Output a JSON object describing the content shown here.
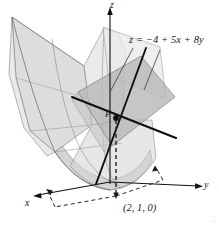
{
  "figure": {
    "caption_absent": true,
    "labels": {
      "plane_equation": "z = −4 + 5x + 8y",
      "point_coords": "(2, 1, 0)",
      "point_name": "P",
      "axis_z": "z",
      "axis_y": "y",
      "axis_x": "x",
      "page_artifact": "2"
    },
    "colors": {
      "background": "#ffffff",
      "surface_fill": "#d6d6d6",
      "surface_fill_light": "#e4e4e4",
      "surface_fill_pale": "#ececeb",
      "plane_fill": "#b9b9b9",
      "plane_fill_light": "#cfcfcf",
      "outline": "#6f6f6f",
      "axis": "#111111",
      "tangent_line": "#111111",
      "dashed": "#2b2b2b",
      "label_text": "#1a1a1a"
    },
    "geometry": {
      "origin": {
        "x": 110,
        "y": 182
      },
      "point_P": {
        "x": 116,
        "y": 118
      },
      "point_base": {
        "x": 116,
        "y": 194
      },
      "z_axis_top": {
        "x": 110,
        "y": 10
      },
      "y_axis_end": {
        "x": 200,
        "y": 185
      },
      "x_axis_end": {
        "x": 34,
        "y": 196
      }
    },
    "elements": [
      "paraboloid-surface",
      "tangent-plane",
      "tangent-line-x",
      "tangent-line-y",
      "z-axis",
      "y-axis",
      "x-axis",
      "dashed-projection",
      "leader-lines"
    ]
  }
}
